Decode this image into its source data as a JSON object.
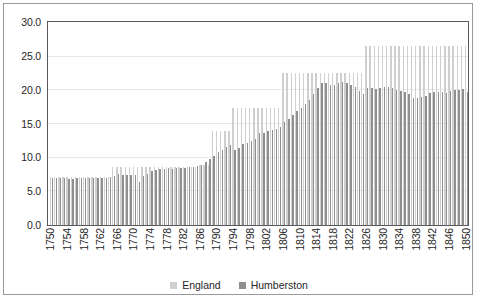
{
  "chart_data": {
    "type": "bar",
    "title": "",
    "xlabel": "",
    "ylabel": "",
    "ylim": [
      0.0,
      30.0
    ],
    "ytick_step": 5.0,
    "ytick_labels": [
      "0.0",
      "5.0",
      "10.0",
      "15.0",
      "20.0",
      "25.0",
      "30.0"
    ],
    "ytick_values": [
      0.0,
      5.0,
      10.0,
      15.0,
      20.0,
      25.0,
      30.0
    ],
    "grid": true,
    "grid_axis": "y",
    "legend_position": "bottom",
    "xtick_step": 4,
    "xtick_labels": [
      "1750",
      "1754",
      "1758",
      "1762",
      "1766",
      "1770",
      "1774",
      "1778",
      "1782",
      "1786",
      "1790",
      "1794",
      "1798",
      "1802",
      "1806",
      "1810",
      "1814",
      "1818",
      "1822",
      "1826",
      "1830",
      "1834",
      "1838",
      "1842",
      "1846",
      "1850"
    ],
    "categories": [
      1750,
      1751,
      1752,
      1753,
      1754,
      1755,
      1756,
      1757,
      1758,
      1759,
      1760,
      1761,
      1762,
      1763,
      1764,
      1765,
      1766,
      1767,
      1768,
      1769,
      1770,
      1771,
      1772,
      1773,
      1774,
      1775,
      1776,
      1777,
      1778,
      1779,
      1780,
      1781,
      1782,
      1783,
      1784,
      1785,
      1786,
      1787,
      1788,
      1789,
      1790,
      1791,
      1792,
      1793,
      1794,
      1795,
      1796,
      1797,
      1798,
      1799,
      1800,
      1801,
      1802,
      1803,
      1804,
      1805,
      1806,
      1807,
      1808,
      1809,
      1810,
      1811,
      1812,
      1813,
      1814,
      1815,
      1816,
      1817,
      1818,
      1819,
      1820,
      1821,
      1822,
      1823,
      1824,
      1825,
      1826,
      1827,
      1828,
      1829,
      1830,
      1831,
      1832,
      1833,
      1834,
      1835,
      1836,
      1837,
      1838,
      1839,
      1840,
      1841,
      1842,
      1843,
      1844,
      1845,
      1846,
      1847,
      1848,
      1849,
      1850
    ],
    "series": [
      {
        "name": "England",
        "color": "#cfcfcf",
        "values": [
          7.1,
          7.1,
          7.1,
          7.1,
          7.1,
          7.1,
          7.1,
          7.1,
          7.1,
          7.1,
          7.1,
          7.1,
          7.1,
          7.1,
          7.1,
          8.6,
          8.6,
          8.6,
          8.6,
          8.6,
          8.6,
          8.6,
          8.6,
          8.6,
          8.6,
          8.6,
          8.6,
          8.6,
          8.6,
          8.6,
          8.6,
          8.6,
          8.6,
          8.6,
          8.6,
          8.6,
          8.9,
          8.9,
          8.9,
          14.0,
          14.0,
          14.0,
          14.0,
          14.0,
          17.4,
          17.4,
          17.4,
          17.4,
          17.4,
          17.4,
          17.4,
          17.4,
          17.4,
          17.4,
          17.4,
          17.4,
          22.5,
          22.5,
          22.5,
          22.5,
          22.5,
          22.5,
          22.5,
          22.5,
          22.5,
          22.5,
          22.5,
          22.5,
          22.5,
          22.5,
          22.5,
          22.5,
          22.5,
          22.5,
          22.5,
          22.5,
          26.5,
          26.5,
          26.5,
          26.5,
          26.5,
          26.5,
          26.5,
          26.5,
          26.5,
          26.5,
          26.5,
          26.5,
          26.5,
          26.5,
          26.5,
          26.5,
          26.5,
          26.5,
          26.5,
          26.5,
          26.5,
          26.5,
          26.5,
          26.5,
          26.5
        ]
      },
      {
        "name": "Humberston",
        "color": "#8f8f8f",
        "values": [
          7.0,
          7.0,
          7.0,
          7.0,
          6.9,
          6.9,
          7.0,
          7.0,
          7.0,
          7.0,
          7.0,
          7.0,
          7.0,
          7.0,
          7.1,
          7.3,
          7.5,
          7.4,
          7.4,
          7.4,
          7.4,
          6.4,
          7.2,
          7.6,
          8.0,
          8.2,
          8.3,
          8.3,
          8.4,
          8.3,
          8.4,
          8.4,
          8.4,
          8.6,
          8.6,
          8.7,
          8.9,
          9.3,
          9.8,
          10.2,
          10.8,
          11.2,
          11.6,
          11.9,
          11.2,
          11.4,
          12.0,
          12.2,
          12.4,
          12.8,
          13.6,
          13.7,
          13.9,
          14.1,
          14.3,
          14.6,
          15.3,
          15.8,
          16.3,
          16.9,
          17.4,
          18.0,
          18.6,
          19.4,
          20.4,
          21.0,
          21.0,
          20.7,
          20.8,
          21.0,
          21.2,
          21.1,
          20.7,
          20.5,
          19.9,
          19.4,
          20.3,
          20.4,
          20.2,
          20.4,
          20.5,
          20.5,
          20.3,
          20.0,
          19.9,
          19.7,
          19.4,
          18.9,
          18.8,
          19.0,
          19.2,
          19.6,
          19.8,
          19.8,
          19.8,
          19.6,
          19.9,
          20.0,
          20.1,
          20.2,
          19.7
        ]
      }
    ]
  },
  "legend": {
    "items": [
      {
        "label": "England",
        "color": "#cfcfcf"
      },
      {
        "label": "Humberston",
        "color": "#8f8f8f"
      }
    ]
  }
}
